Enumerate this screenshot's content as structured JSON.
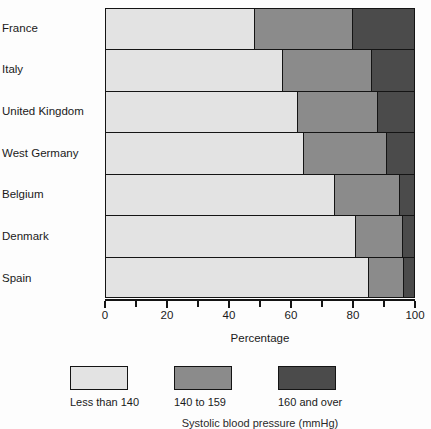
{
  "chart_data": {
    "type": "bar",
    "orientation": "horizontal",
    "stacked": true,
    "stack_mode": "percent",
    "title": "",
    "xlabel": "Percentage",
    "ylabel": "",
    "xlim": [
      0,
      100
    ],
    "xticks": [
      0,
      10,
      20,
      30,
      40,
      50,
      60,
      70,
      80,
      90,
      100
    ],
    "xtick_labels": [
      "0",
      "",
      "20",
      "",
      "40",
      "",
      "60",
      "",
      "80",
      "",
      "100"
    ],
    "grid": false,
    "legend_position": "bottom",
    "categories": [
      "France",
      "Italy",
      "United Kingdom",
      "West Germany",
      "Belgium",
      "Denmark",
      "Spain"
    ],
    "series": [
      {
        "name": "Less than 140",
        "color": "#e3e3e3",
        "values": [
          48,
          57,
          62,
          64,
          74,
          81,
          85
        ]
      },
      {
        "name": "140 to 159",
        "color": "#8b8b8b",
        "values": [
          32,
          29,
          26,
          27,
          21,
          15,
          11.5
        ]
      },
      {
        "name": "160 and over",
        "color": "#4b4b4b",
        "values": [
          20,
          14,
          12,
          9,
          5,
          4,
          3.5
        ]
      }
    ]
  },
  "axis": {
    "title": "Percentage",
    "tick_labels": [
      "0",
      "20",
      "40",
      "60",
      "80",
      "100"
    ]
  },
  "legend": {
    "items": [
      {
        "label": "Less than 140",
        "swatch": "s1"
      },
      {
        "label": "140 to 159",
        "swatch": "s2"
      },
      {
        "label": "160 and over",
        "swatch": "s3"
      }
    ]
  },
  "caption": {
    "text": "Systolic blood pressure (mmHg)"
  },
  "colors": {
    "series_light": "#e3e3e3",
    "series_mid": "#8b8b8b",
    "series_dark": "#4b4b4b",
    "outline": "#141414"
  }
}
